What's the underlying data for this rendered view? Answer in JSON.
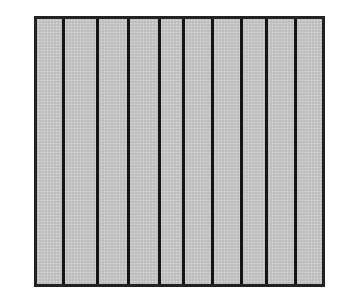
{
  "diagram": {
    "fill_color": "#c4c4c4",
    "line_color": "#151515",
    "strip_count": 10,
    "divider_positions_px": [
      28,
      62,
      93,
      124,
      148,
      177,
      206,
      231,
      260
    ]
  }
}
